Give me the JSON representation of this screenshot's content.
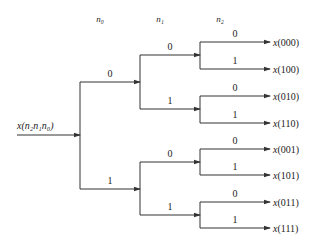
{
  "diagram": {
    "input_label": "x(n₂n₁n₀)",
    "stage_headers": [
      "n₀",
      "n₁",
      "n₂"
    ],
    "stage1": [
      {
        "bit": "0",
        "y": 82
      },
      {
        "bit": "1",
        "y": 189
      }
    ],
    "stage2": [
      {
        "bit": "0",
        "y": 55
      },
      {
        "bit": "1",
        "y": 109
      },
      {
        "bit": "0",
        "y": 162
      },
      {
        "bit": "1",
        "y": 215
      }
    ],
    "stage3": [
      {
        "bit": "0",
        "y": 42,
        "output": "x(000)"
      },
      {
        "bit": "1",
        "y": 69,
        "output": "x(100)"
      },
      {
        "bit": "0",
        "y": 96,
        "output": "x(010)"
      },
      {
        "bit": "1",
        "y": 123,
        "output": "x(110)"
      },
      {
        "bit": "0",
        "y": 149,
        "output": "x(001)"
      },
      {
        "bit": "1",
        "y": 175,
        "output": "x(101)"
      },
      {
        "bit": "0",
        "y": 202,
        "output": "x(011)"
      },
      {
        "bit": "1",
        "y": 228,
        "output": "x(111)"
      }
    ],
    "line_color": "#333333"
  }
}
